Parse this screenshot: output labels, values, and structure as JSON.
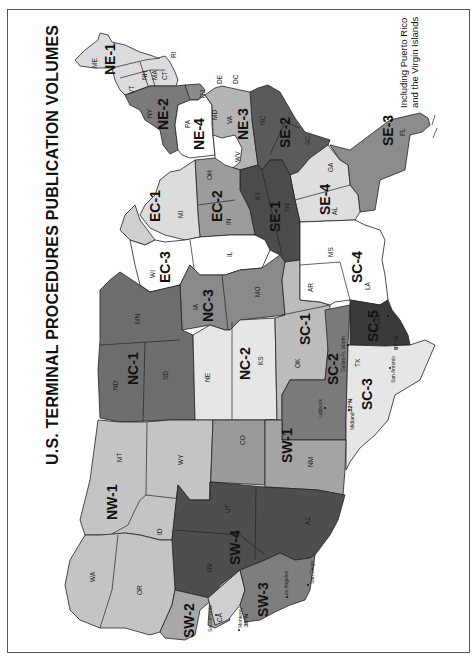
{
  "title": "U.S. TERMINAL PROCEDURES PUBLICATION VOLUMES",
  "note": {
    "line1": "Including Puerto Rico",
    "line2": "and the Virgin Islands"
  },
  "colors": {
    "darkest": "#3a3a3a",
    "dark": "#5c5c5c",
    "medium": "#8e8e8e",
    "light": "#bdbdbd",
    "lighter": "#dcdcdc",
    "white": "#ffffff",
    "border": "#555555"
  },
  "regions": {
    "NE-1": "NE-1",
    "NE-2": "NE-2",
    "NE-3": "NE-3",
    "NE-4": "NE-4",
    "SE-1": "SE-1",
    "SE-2": "SE-2",
    "SE-3": "SE-3",
    "SE-4": "SE-4",
    "EC-1": "EC-1",
    "EC-2": "EC-2",
    "EC-3": "EC-3",
    "NC-1": "NC-1",
    "NC-2": "NC-2",
    "NC-3": "NC-3",
    "SC-1": "SC-1",
    "SC-2": "SC-2",
    "SC-3": "SC-3",
    "SC-4": "SC-4",
    "SC-5": "SC-5",
    "SW-1": "SW-1",
    "SW-2": "SW-2",
    "SW-3": "SW-3",
    "SW-4": "SW-4",
    "NW-1": "NW-1"
  },
  "states": {
    "ME": "ME",
    "NH": "NH",
    "VT": "VT",
    "MA": "MA",
    "CT": "CT",
    "RI": "RI",
    "NY": "NY",
    "NJ": "NJ",
    "PA": "PA",
    "DE": "DE",
    "DC": "DC",
    "MD": "MD",
    "VA": "VA",
    "WV": "WV",
    "NC": "NC",
    "SC": "SC",
    "GA": "GA",
    "FL": "FL",
    "AL": "AL",
    "TN": "TN",
    "KY": "KY",
    "OH": "OH",
    "IN": "IN",
    "MI": "MI",
    "IL": "IL",
    "WI": "WI",
    "MN": "MN",
    "IA": "IA",
    "MO": "MO",
    "AR": "AR",
    "MS": "MS",
    "LA": "LA",
    "ND": "ND",
    "SD": "SD",
    "NE": "NE",
    "KS": "KS",
    "OK": "OK",
    "TX": "TX",
    "MT": "MT",
    "WY": "WY",
    "CO": "CO",
    "NM": "NM",
    "ID": "ID",
    "UT": "UT",
    "AZ": "AZ",
    "NV": "NV",
    "WA": "WA",
    "OR": "OR",
    "CA": "CA"
  },
  "cities": {
    "dallas": "Dallas-Ft. Worth",
    "lubbock": "Lubbock",
    "midland": "Midland",
    "san_antonio": "San Antonio",
    "houston": "Houston",
    "sacramento": "Sacramento",
    "monterey": "Monterey",
    "los_angeles": "Los Angeles",
    "san_diego": "San Diego"
  },
  "meridians": {
    "lat32": "32°N",
    "lon97": "97°W",
    "lat36": "36°N"
  }
}
